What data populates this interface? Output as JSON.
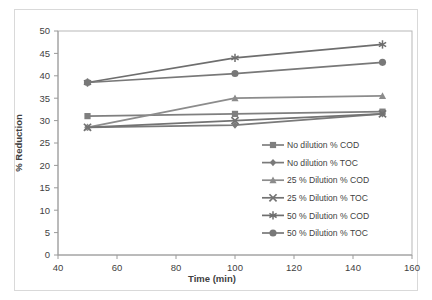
{
  "chart_data": {
    "type": "line",
    "title": "",
    "xlabel": "Time (min)",
    "ylabel": "% Reduction",
    "x": [
      50,
      100,
      150
    ],
    "xlim": [
      40,
      160
    ],
    "ylim": [
      0,
      50
    ],
    "xticks": [
      40,
      60,
      80,
      100,
      120,
      140,
      160
    ],
    "yticks": [
      0,
      5,
      10,
      15,
      20,
      25,
      30,
      35,
      40,
      45,
      50
    ],
    "grid": false,
    "legend_position": "inside-lower-right",
    "series": [
      {
        "name": "No dilution % COD",
        "marker": "square",
        "color": "#7f7f7f",
        "values": [
          31.0,
          31.5,
          32.0
        ]
      },
      {
        "name": "No dilution % TOC",
        "marker": "diamond",
        "color": "#7a7a7a",
        "values": [
          28.5,
          29.0,
          31.5
        ]
      },
      {
        "name": "25 % Dilution % COD",
        "marker": "triangle",
        "color": "#8c8c8c",
        "values": [
          28.5,
          35.0,
          35.5
        ]
      },
      {
        "name": "25 % Dilution % TOC",
        "marker": "x-cross",
        "color": "#737373",
        "values": [
          28.5,
          30.0,
          31.5
        ]
      },
      {
        "name": "50 % Dilution % COD",
        "marker": "asterisk",
        "color": "#6e6e6e",
        "values": [
          38.5,
          44.0,
          47.0
        ]
      },
      {
        "name": "50 % Dilution % TOC",
        "marker": "circle",
        "color": "#787878",
        "values": [
          38.5,
          40.5,
          43.0
        ]
      }
    ]
  },
  "axis": {
    "y_title": "% Reduction",
    "x_title": "Time (min)",
    "y_tick_labels": [
      "50",
      "45",
      "40",
      "35",
      "30",
      "25",
      "20",
      "15",
      "10",
      "5",
      "0"
    ],
    "x_tick_labels": [
      "40",
      "60",
      "80",
      "100",
      "120",
      "140",
      "160"
    ]
  },
  "legend": {
    "items": [
      {
        "label": "No dilution % COD"
      },
      {
        "label": "No dilution % TOC"
      },
      {
        "label": "25 % Dilution % COD"
      },
      {
        "label": "25 % Dilution % TOC"
      },
      {
        "label": "50 % Dilution % COD"
      },
      {
        "label": "50 % Dilution % TOC"
      }
    ]
  }
}
